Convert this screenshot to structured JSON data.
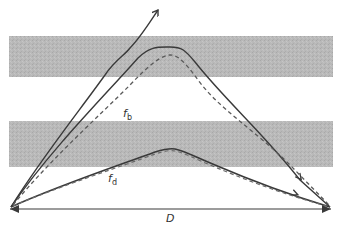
{
  "diagram": {
    "type": "trajectory-diagram",
    "colors": {
      "band": "#b8b8b8",
      "line": "#3a3a3a",
      "dashed": "#5a5a5a",
      "background": "#ffffff"
    },
    "bands": [
      {
        "name": "upper-band",
        "x": 9,
        "y": 36,
        "w": 324,
        "h": 41
      },
      {
        "name": "lower-band",
        "x": 9,
        "y": 121,
        "w": 324,
        "h": 46
      }
    ],
    "labels": {
      "fb_main": "f",
      "fb_sub": "b",
      "fd_main": "f",
      "fd_sub": "d",
      "distance": "D"
    },
    "curves": [
      {
        "name": "escaping-trajectory",
        "style": "solid",
        "description": "rises from origin and exits upward with arrow"
      },
      {
        "name": "high-solid-trajectory",
        "style": "solid",
        "description": "peaks in upper band, ends at right with arrow"
      },
      {
        "name": "high-dashed-trajectory",
        "style": "dashed",
        "label": "fb"
      },
      {
        "name": "low-solid-trajectory",
        "style": "solid",
        "description": "peaks in lower band, ends at right with arrow"
      },
      {
        "name": "low-dashed-trajectory",
        "style": "dashed",
        "label": "fd"
      }
    ],
    "distance_axis": {
      "label": "D",
      "from_x": 9,
      "to_x": 333,
      "y": 207
    }
  }
}
